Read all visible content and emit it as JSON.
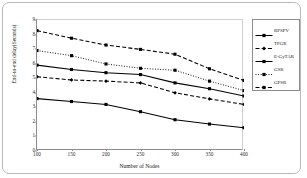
{
  "chart_data": {
    "type": "line",
    "title": "",
    "xlabel": "Number of Nodes",
    "ylabel": "End-to-end delay(Seconds)",
    "x": [
      100,
      150,
      200,
      250,
      300,
      350,
      400
    ],
    "xticklabels": [
      "100",
      "150",
      "200",
      "250",
      "300",
      "350",
      "400"
    ],
    "yticklabels": [
      "0",
      "1",
      "2",
      "3",
      "4",
      "5",
      "6",
      "7",
      "8",
      "9"
    ],
    "xlim": [
      100,
      400
    ],
    "ylim": [
      0,
      9
    ],
    "grid": false,
    "legend_position": "right",
    "series": [
      {
        "name": "RPSPV",
        "values": [
          3.6,
          3.4,
          3.2,
          2.7,
          2.15,
          1.85,
          1.6
        ],
        "style": "solid",
        "marker": "square",
        "color": "#000000"
      },
      {
        "name": "TPGR",
        "values": [
          5.1,
          4.88,
          4.8,
          4.68,
          4.0,
          3.58,
          3.2
        ],
        "style": "dashed",
        "marker": "diamond",
        "color": "#000000"
      },
      {
        "name": "E-GyTAR",
        "values": [
          5.9,
          5.6,
          5.38,
          5.25,
          4.68,
          4.28,
          3.78
        ],
        "style": "solid",
        "marker": "square",
        "color": "#000000"
      },
      {
        "name": "GSR",
        "values": [
          6.9,
          6.55,
          5.98,
          5.68,
          5.55,
          4.8,
          4.15
        ],
        "style": "dotted",
        "marker": "square",
        "color": "#000000"
      },
      {
        "name": "GPSR",
        "values": [
          8.27,
          7.75,
          7.28,
          6.98,
          6.65,
          5.65,
          4.85
        ],
        "style": "dashed",
        "marker": "square",
        "color": "#000000"
      }
    ]
  }
}
